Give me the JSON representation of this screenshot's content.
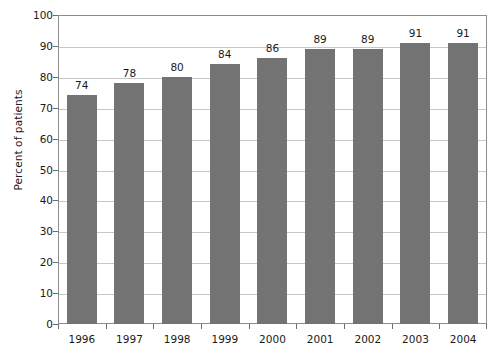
{
  "chart_data": {
    "type": "bar",
    "title": "",
    "subtitle": "",
    "xlabel": "",
    "ylabel": "Percent of patients",
    "categories": [
      "1996",
      "1997",
      "1998",
      "1999",
      "2000",
      "2001",
      "2002",
      "2003",
      "2004"
    ],
    "values": [
      74,
      78,
      80,
      84,
      86,
      89,
      89,
      91,
      91
    ],
    "data_labels": [
      "74",
      "78",
      "80",
      "84",
      "86",
      "89",
      "89",
      "91",
      "91"
    ],
    "ylim": [
      0,
      100
    ],
    "y_tick_step": 10,
    "y_tick_labels": [
      "100",
      "90",
      "80",
      "70",
      "60",
      "50",
      "40",
      "30",
      "20",
      "10",
      "0"
    ],
    "grid": true,
    "grid_axis": "y",
    "legend": false,
    "legend_position": "none",
    "bar_color": "#737373",
    "grid_color": "#c8c8c8",
    "frame_color": "#8c8c8c",
    "text_color": "#1a1a1a",
    "background_color": "#ffffff"
  }
}
